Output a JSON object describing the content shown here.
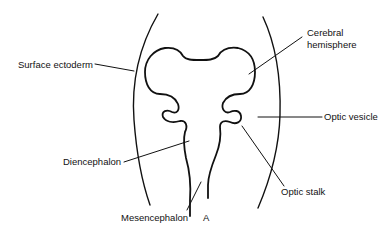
{
  "figure": {
    "panel_letter": "A",
    "labels": {
      "surface_ectoderm": "Surface ectoderm",
      "cerebral_hemisphere_line1": "Cerebral",
      "cerebral_hemisphere_line2": "hemisphere",
      "optic_vesicle": "Optic vesicle",
      "diencephalon": "Diencephalon",
      "optic_stalk": "Optic stalk",
      "mesencephalon": "Mesencephalon"
    },
    "colors": {
      "stroke": "#111111",
      "background": "#ffffff"
    }
  }
}
